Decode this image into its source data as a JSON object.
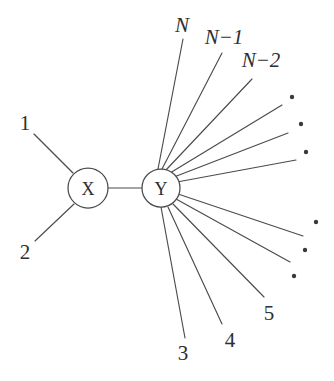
{
  "diagram": {
    "colors": {
      "background": "#ffffff",
      "stroke": "#4b4b4b",
      "text": "#2e2e2e",
      "dot": "#3a3a3a"
    },
    "nodes": [
      {
        "id": "node-x",
        "label": "X",
        "cx": 88,
        "cy": 188,
        "r": 20
      },
      {
        "id": "node-y",
        "label": "Y",
        "cx": 161,
        "cy": 188,
        "r": 19
      }
    ],
    "internal_edges": [
      {
        "id": "edge-x-y",
        "x1": 108,
        "y1": 188,
        "x2": 142,
        "y2": 188
      }
    ],
    "leaf_edges": [
      {
        "id": "edge-leaf-1",
        "x1": 73,
        "y1": 173,
        "x2": 34,
        "y2": 134
      },
      {
        "id": "edge-leaf-2",
        "x1": 74,
        "y1": 204,
        "x2": 35,
        "y2": 241
      },
      {
        "id": "edge-leaf-N",
        "x1": 158,
        "y1": 169,
        "x2": 183,
        "y2": 39
      },
      {
        "id": "edge-leaf-N1",
        "x1": 162,
        "y1": 169,
        "x2": 222,
        "y2": 53
      },
      {
        "id": "edge-leaf-N2",
        "x1": 166,
        "y1": 170,
        "x2": 252,
        "y2": 79
      },
      {
        "id": "edge-leaf-dot-ur1",
        "x1": 170,
        "y1": 173,
        "x2": 282,
        "y2": 105
      },
      {
        "id": "edge-leaf-dot-ur2",
        "x1": 174,
        "y1": 177,
        "x2": 288,
        "y2": 133
      },
      {
        "id": "edge-leaf-dot-ur3",
        "x1": 177,
        "y1": 182,
        "x2": 296,
        "y2": 160
      },
      {
        "id": "edge-leaf-dot-lr1",
        "x1": 178,
        "y1": 194,
        "x2": 303,
        "y2": 236
      },
      {
        "id": "edge-leaf-dot-lr2",
        "x1": 176,
        "y1": 199,
        "x2": 290,
        "y2": 262
      },
      {
        "id": "edge-leaf-5",
        "x1": 173,
        "y1": 204,
        "x2": 264,
        "y2": 297
      },
      {
        "id": "edge-leaf-4",
        "x1": 168,
        "y1": 207,
        "x2": 222,
        "y2": 324
      },
      {
        "id": "edge-leaf-3",
        "x1": 161,
        "y1": 207,
        "x2": 185,
        "y2": 338
      }
    ],
    "leaf_labels": [
      {
        "id": "label-1",
        "text": "1",
        "x": 25,
        "y": 123,
        "italic": false
      },
      {
        "id": "label-2",
        "text": "2",
        "x": 25,
        "y": 252,
        "italic": false
      },
      {
        "id": "label-3",
        "text": "3",
        "x": 183,
        "y": 353,
        "italic": false
      },
      {
        "id": "label-4",
        "text": "4",
        "x": 230,
        "y": 340,
        "italic": false
      },
      {
        "id": "label-5",
        "text": "5",
        "x": 269,
        "y": 313,
        "italic": false
      },
      {
        "id": "label-N",
        "text": "N",
        "x": 182,
        "y": 25,
        "italic": true
      },
      {
        "id": "label-N-1",
        "text": "N−1",
        "x": 224,
        "y": 37,
        "italic": true
      },
      {
        "id": "label-N-2",
        "text": "N−2",
        "x": 261,
        "y": 60,
        "italic": true
      }
    ],
    "ellipsis_dots": [
      {
        "id": "dot-ur-1",
        "cx": 292,
        "cy": 97,
        "r": 2.2
      },
      {
        "id": "dot-ur-2",
        "cx": 301,
        "cy": 124,
        "r": 2.2
      },
      {
        "id": "dot-ur-3",
        "cx": 306,
        "cy": 152,
        "r": 2.2
      },
      {
        "id": "dot-lr-1",
        "cx": 316,
        "cy": 222,
        "r": 2.2
      },
      {
        "id": "dot-lr-2",
        "cx": 305,
        "cy": 250,
        "r": 2.2
      },
      {
        "id": "dot-lr-3",
        "cx": 294,
        "cy": 276,
        "r": 2.2
      }
    ]
  }
}
